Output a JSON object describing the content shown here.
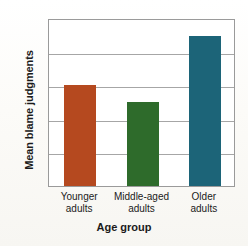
{
  "chart_data": {
    "type": "bar",
    "title": "",
    "xlabel": "Age group",
    "ylabel": "Mean blame judgments",
    "categories": [
      "Younger adults",
      "Middle-aged adults",
      "Older adults"
    ],
    "category_lines": [
      [
        "Younger",
        "adults"
      ],
      [
        "Middle-aged",
        "adults"
      ],
      [
        "Older",
        "adults"
      ]
    ],
    "values": [
      4.2,
      4.1,
      4.49
    ],
    "bar_colors": [
      "#b5491f",
      "#2e6b2b",
      "#1c6478"
    ],
    "ylim": [
      3.6,
      4.6
    ],
    "ytick_values": [
      3.6,
      3.8,
      4.0,
      4.2,
      4.4,
      4.6
    ],
    "ytick_labels": [
      "3.6",
      "3.8",
      "4.0",
      "4.2",
      "4.4",
      "4.6"
    ],
    "grid": true,
    "legend": false,
    "legend_position": "none",
    "frame_color": "#9a9a9a",
    "gridline_color": "#a6a6a6",
    "plot_background": "#ffffff"
  }
}
